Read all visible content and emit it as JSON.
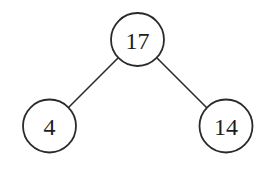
{
  "diagram": {
    "type": "binary-tree",
    "nodes": [
      {
        "id": "root",
        "label": "17",
        "cx": 137.5,
        "cy": 39.5,
        "r": 26.5
      },
      {
        "id": "left",
        "label": "4",
        "cx": 49.5,
        "cy": 126,
        "r": 26.5
      },
      {
        "id": "right",
        "label": "14",
        "cx": 226,
        "cy": 126,
        "r": 26.5
      }
    ],
    "edges": [
      {
        "from": "root",
        "to": "left",
        "x1": 118,
        "y1": 58,
        "x2": 68,
        "y2": 108
      },
      {
        "from": "root",
        "to": "right",
        "x1": 157,
        "y1": 58,
        "x2": 207,
        "y2": 108
      }
    ],
    "colors": {
      "stroke": "#2a2a2a",
      "text": "#1e1e1e",
      "background": "#ffffff"
    }
  }
}
